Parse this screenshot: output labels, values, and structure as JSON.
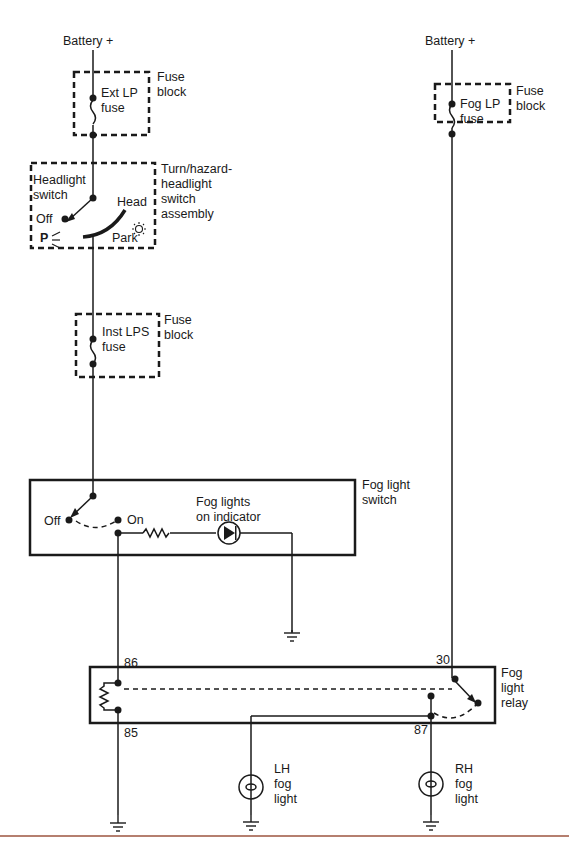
{
  "diagram": {
    "left_circuit": {
      "battery_label": "Battery +",
      "ext_lp_fuse": {
        "label": "Ext LP\nfuse",
        "block_label": "Fuse\nblock"
      },
      "headlight_switch": {
        "label": "Headlight\nswitch",
        "assembly_label": "Turn/hazard-\nheadlight\nswitch\nassembly",
        "positions": {
          "off": "Off",
          "head": "Head",
          "park": "Park",
          "p_symbol": "P"
        }
      },
      "inst_lps_fuse": {
        "label": "Inst LPS\nfuse",
        "block_label": "Fuse\nblock"
      },
      "fog_light_switch": {
        "label": "Fog light\nswitch",
        "off": "Off",
        "on": "On",
        "indicator_label": "Fog lights\non indicator"
      }
    },
    "right_circuit": {
      "battery_label": "Battery +",
      "fog_lp_fuse": {
        "label": "Fog LP\nfuse",
        "block_label": "Fuse\nblock"
      }
    },
    "relay": {
      "label": "Fog\nlight\nrelay",
      "terminals": {
        "t86": "86",
        "t85": "85",
        "t30": "30",
        "t87": "87"
      }
    },
    "lamps": {
      "lh": "LH\nfog\nlight",
      "rh": "RH\nfog\nlight"
    },
    "colors": {
      "line": "#1a1a1a",
      "bottom_rule": "#b57f6f"
    }
  }
}
